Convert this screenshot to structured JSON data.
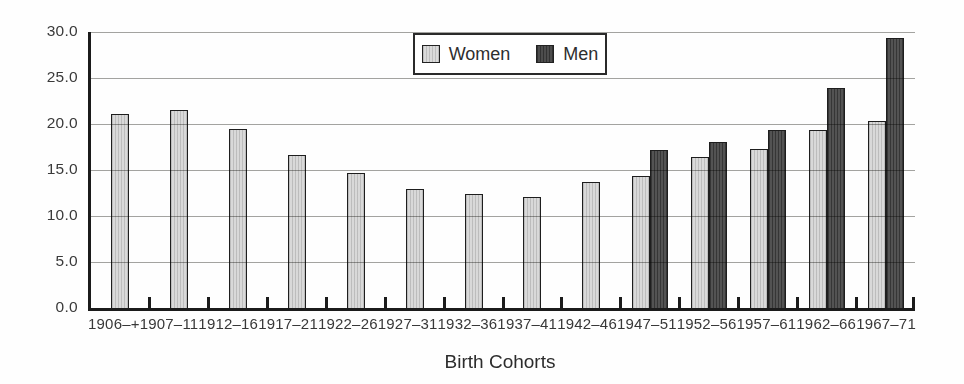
{
  "chart_data": {
    "type": "bar",
    "title": "",
    "xlabel": "Birth Cohorts",
    "ylabel": "",
    "categories": [
      "1906–+",
      "1907–11",
      "1912–16",
      "1917–21",
      "1922–26",
      "1927–31",
      "1932–36",
      "1937–41",
      "1942–46",
      "1947–51",
      "1952–56",
      "1957–61",
      "1962–66",
      "1967–71"
    ],
    "series": [
      {
        "name": "Women",
        "color": "#dadada",
        "values": [
          21.1,
          21.5,
          19.5,
          16.6,
          14.7,
          12.9,
          12.4,
          12.1,
          13.7,
          14.3,
          16.4,
          17.3,
          19.4,
          20.3
        ]
      },
      {
        "name": "Men",
        "color": "#4d4d4d",
        "values": [
          null,
          null,
          null,
          null,
          null,
          null,
          null,
          null,
          null,
          17.2,
          18.0,
          19.4,
          23.9,
          29.4
        ]
      }
    ],
    "ylim": [
      0,
      30
    ],
    "ytick_step": 5,
    "ytick_labels": [
      "0.0",
      "5.0",
      "10.0",
      "15.0",
      "20.0",
      "25.0",
      "30.0"
    ],
    "grid": true,
    "legend_position": "top-center"
  },
  "colors": {
    "women_bar": "#dadada",
    "men_bar": "#4d4d4d",
    "axis": "#1b1b1b",
    "gridline": "#a3a3a0",
    "text": "#333333",
    "background": "#fefefe"
  }
}
